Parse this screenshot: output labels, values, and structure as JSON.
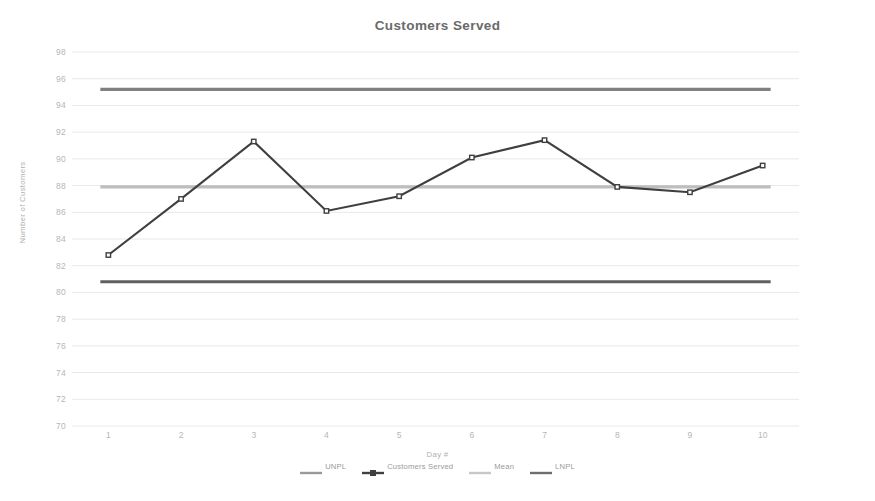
{
  "chart_data": {
    "type": "line",
    "title": "Customers Served",
    "xlabel": "Day #",
    "ylabel": "Number of Customers",
    "categories": [
      "1",
      "2",
      "3",
      "4",
      "5",
      "6",
      "7",
      "8",
      "9",
      "10"
    ],
    "x": [
      1,
      2,
      3,
      4,
      5,
      6,
      7,
      8,
      9,
      10
    ],
    "ylim": [
      70,
      98
    ],
    "ytick_step": 2,
    "yticks": [
      70,
      72,
      74,
      76,
      78,
      80,
      82,
      84,
      86,
      88,
      90,
      92,
      94,
      96,
      98
    ],
    "grid": true,
    "grid_axis": "y",
    "legend_position": "bottom",
    "series": [
      {
        "name": "UNPL",
        "type": "constant-line",
        "value": 95.2,
        "color": "#808080",
        "marker": "none"
      },
      {
        "name": "Customers Served",
        "type": "line",
        "values": [
          82.8,
          87.0,
          91.3,
          86.1,
          87.2,
          90.1,
          91.4,
          87.9,
          87.5,
          89.5
        ],
        "color": "#3f3f3f",
        "marker": "square"
      },
      {
        "name": "Mean",
        "type": "constant-line",
        "value": 87.9,
        "color": "#bdbdbd",
        "marker": "none"
      },
      {
        "name": "LNPL",
        "type": "constant-line",
        "value": 80.8,
        "color": "#606060",
        "marker": "none"
      }
    ]
  },
  "legend": {
    "items": [
      {
        "label": "UNPL",
        "color": "#9a9a9a"
      },
      {
        "label": "Customers Served",
        "color": "#3f3f3f"
      },
      {
        "label": "Mean",
        "color": "#c8c8c8"
      },
      {
        "label": "LNPL",
        "color": "#6e6e6e"
      }
    ]
  },
  "colors": {
    "background": "#ffffff",
    "grid": "#e8e8e8",
    "title_text": "#6a6a6a",
    "tick_text": "#b6b6b6",
    "axis_title_text": "#b0b0b0"
  }
}
